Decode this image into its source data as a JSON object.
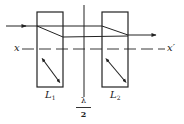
{
  "diagram": {
    "title": "",
    "colors": {
      "ink": "#222222",
      "background": "#ffffff"
    },
    "labels": {
      "axis_left": "x",
      "axis_right": "x′",
      "plate1_main": "L",
      "plate1_sub": "1",
      "plate2_main": "L",
      "plate2_sub": "2",
      "halfwave_num": "λ",
      "halfwave_den": "2"
    },
    "components": [
      {
        "id": "L1",
        "type": "birefringent-plate",
        "box": [
          37,
          12,
          63,
          87
        ],
        "optic_axis_arrow": [
          [
            43,
            60
          ],
          [
            59,
            81
          ]
        ]
      },
      {
        "id": "halfwave",
        "type": "half-wave-plate",
        "line_x": 84,
        "y_range": [
          5,
          97
        ]
      },
      {
        "id": "L2",
        "type": "birefringent-plate",
        "box": [
          102,
          12,
          128,
          87
        ],
        "optic_axis_arrow": [
          [
            107,
            60
          ],
          [
            125,
            81
          ]
        ]
      }
    ],
    "beams": {
      "incident": {
        "from": [
          6,
          26
        ],
        "to": [
          37,
          26
        ]
      },
      "ordinary": {
        "from": [
          37,
          26
        ],
        "to": [
          102,
          26
        ]
      },
      "extraordinary_split": {
        "from": [
          37,
          26
        ],
        "to": [
          63,
          37
        ]
      },
      "extraordinary": {
        "from": [
          63,
          37
        ],
        "to": [
          128,
          37
        ]
      },
      "ordinary_recombine": {
        "from": [
          102,
          26
        ],
        "to": [
          128,
          35
        ]
      },
      "exit": {
        "from": [
          128,
          35
        ],
        "to": [
          156,
          35
        ]
      }
    },
    "axis": {
      "y": 49,
      "x_start": 22,
      "x_end": 165,
      "style": "dashed"
    }
  }
}
